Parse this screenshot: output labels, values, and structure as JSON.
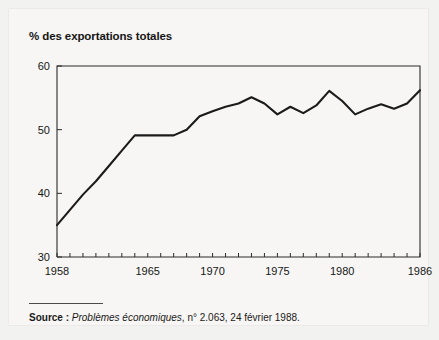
{
  "figure": {
    "title": "% des exportations totales",
    "source_label": "Source :",
    "source_italic": "Problèmes économiques",
    "source_rest": ", n° 2.063, 24 février 1988."
  },
  "colors": {
    "page_background": "#f2f2f0",
    "card_background": "#f7f6f4",
    "axis": "#2a2a2a",
    "line": "#1b1b1b",
    "text": "#161616"
  },
  "chart_data": {
    "type": "line",
    "title": "% des exportations totales",
    "xlabel": "",
    "ylabel": "% des exportations totales",
    "xlim": [
      1958,
      1986
    ],
    "ylim": [
      30,
      60
    ],
    "grid": false,
    "legend": "none",
    "y_ticks": [
      30,
      40,
      50,
      60
    ],
    "y_tick_labels": [
      "30",
      "40",
      "50",
      "60"
    ],
    "x_ticks": [
      1958,
      1959,
      1960,
      1961,
      1962,
      1963,
      1964,
      1965,
      1966,
      1967,
      1968,
      1969,
      1970,
      1971,
      1972,
      1973,
      1974,
      1975,
      1976,
      1977,
      1978,
      1979,
      1980,
      1981,
      1982,
      1983,
      1984,
      1985,
      1986
    ],
    "x_tick_labels_shown": [
      "1958",
      "1965",
      "1970",
      "1975",
      "1980",
      "1986"
    ],
    "x_labeled_ticks": [
      1958,
      1965,
      1970,
      1975,
      1980,
      1986
    ],
    "series": [
      {
        "name": "% des exportations totales",
        "x": [
          1958,
          1959,
          1960,
          1961,
          1962,
          1963,
          1964,
          1965,
          1966,
          1967,
          1968,
          1969,
          1970,
          1971,
          1972,
          1973,
          1974,
          1975,
          1976,
          1977,
          1978,
          1979,
          1980,
          1981,
          1982,
          1983,
          1984,
          1985,
          1986
        ],
        "values": [
          35.0,
          37.4,
          39.8,
          41.9,
          44.3,
          46.7,
          49.1,
          49.1,
          49.1,
          49.1,
          50.0,
          52.1,
          52.9,
          53.6,
          54.1,
          55.1,
          54.1,
          52.4,
          53.6,
          52.6,
          53.8,
          56.1,
          54.5,
          52.4,
          53.3,
          54.0,
          53.3,
          54.1,
          56.2
        ]
      }
    ]
  }
}
